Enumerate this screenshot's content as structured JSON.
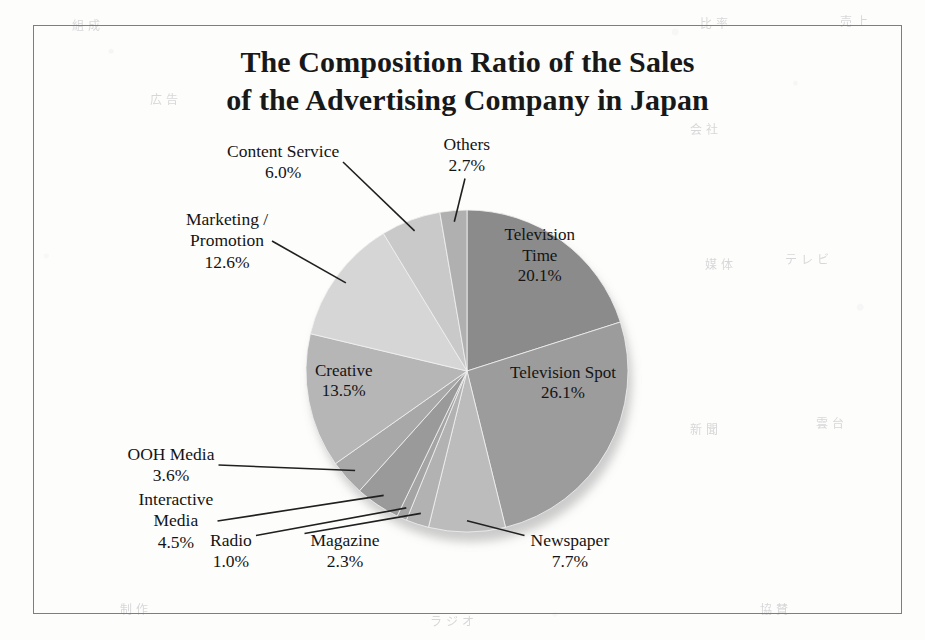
{
  "title": {
    "line1": "The Composition Ratio of the Sales",
    "line2": "of the Advertising Company in Japan"
  },
  "colors": {
    "page_background": "#fdfdfc",
    "frame_border": "#7d7d82",
    "text": "#141414",
    "leader_line": "#202020"
  },
  "ghost_marks": [
    {
      "text": "組 成",
      "x": 72,
      "y": 16
    },
    {
      "text": "比 率",
      "x": 700,
      "y": 14
    },
    {
      "text": "売 上",
      "x": 840,
      "y": 12
    },
    {
      "text": "広 告",
      "x": 150,
      "y": 90
    },
    {
      "text": "会 社",
      "x": 690,
      "y": 120
    },
    {
      "text": "媒 体",
      "x": 705,
      "y": 255
    },
    {
      "text": "テ レ ビ",
      "x": 785,
      "y": 250
    },
    {
      "text": "新 聞",
      "x": 690,
      "y": 420
    },
    {
      "text": "雲 台",
      "x": 816,
      "y": 414
    },
    {
      "text": "制 作",
      "x": 120,
      "y": 600
    },
    {
      "text": "ラ ジ オ",
      "x": 430,
      "y": 612
    },
    {
      "text": "協 賛",
      "x": 760,
      "y": 600
    }
  ],
  "chart_data": {
    "type": "pie",
    "title": "The Composition Ratio of the Sales of the Advertising Company in Japan",
    "unit": "%",
    "start_angle_deg": 0,
    "direction": "clockwise",
    "legend": "none",
    "grid": false,
    "categories": [
      "Television Time",
      "Television Spot",
      "Newspaper",
      "Magazine",
      "Radio",
      "Interactive Media",
      "OOH Media",
      "Creative",
      "Marketing / Promotion",
      "Content Service",
      "Others"
    ],
    "values": [
      20.1,
      26.1,
      7.7,
      2.3,
      1.0,
      4.5,
      3.6,
      13.5,
      12.6,
      6.0,
      2.7
    ],
    "slices": [
      {
        "name": "Television Time",
        "label_line1": "Television",
        "label_line2": "Time",
        "value": 20.1,
        "value_text": "20.1%",
        "color": "#8b8b8b",
        "label_placement": "inside",
        "label_x": 540,
        "label_y": 256
      },
      {
        "name": "Television Spot",
        "label_line1": "Television Spot",
        "label_line2": "",
        "value": 26.1,
        "value_text": "26.1%",
        "color": "#9c9c9c",
        "label_placement": "inside",
        "label_x": 563,
        "label_y": 383
      },
      {
        "name": "Newspaper",
        "label_line1": "Newspaper",
        "label_line2": "",
        "value": 7.7,
        "value_text": "7.7%",
        "color": "#bcbcbc",
        "label_placement": "outside",
        "label_x": 570,
        "label_y": 551
      },
      {
        "name": "Magazine",
        "label_line1": "Magazine",
        "label_line2": "",
        "value": 2.3,
        "value_text": "2.3%",
        "color": "#b2b2b2",
        "label_placement": "outside",
        "label_x": 345,
        "label_y": 551
      },
      {
        "name": "Radio",
        "label_line1": "Radio",
        "label_line2": "",
        "value": 1.0,
        "value_text": "1.0%",
        "color": "#a4a4a4",
        "label_placement": "outside",
        "label_x": 231,
        "label_y": 551
      },
      {
        "name": "Interactive Media",
        "label_line1": "Interactive",
        "label_line2": "Media",
        "value": 4.5,
        "value_text": "4.5%",
        "color": "#9a9a9a",
        "label_placement": "outside",
        "label_x": 176,
        "label_y": 521
      },
      {
        "name": "OOH Media",
        "label_line1": "OOH Media",
        "label_line2": "",
        "value": 3.6,
        "value_text": "3.6%",
        "color": "#a8a8a8",
        "label_placement": "outside",
        "label_x": 171,
        "label_y": 465
      },
      {
        "name": "Creative",
        "label_line1": "Creative",
        "label_line2": "",
        "value": 13.5,
        "value_text": "13.5%",
        "color": "#b6b6b6",
        "label_placement": "inside",
        "label_x": 344,
        "label_y": 381
      },
      {
        "name": "Marketing / Promotion",
        "label_line1": "Marketing /",
        "label_line2": "Promotion",
        "value": 12.6,
        "value_text": "12.6%",
        "color": "#d6d6d6",
        "label_placement": "outside",
        "label_x": 227,
        "label_y": 241
      },
      {
        "name": "Content Service",
        "label_line1": "Content Service",
        "label_line2": "",
        "value": 6.0,
        "value_text": "6.0%",
        "color": "#c9c9c9",
        "label_placement": "outside",
        "label_x": 283,
        "label_y": 162
      },
      {
        "name": "Others",
        "label_line1": "Others",
        "label_line2": "",
        "value": 2.7,
        "value_text": "2.7%",
        "color": "#b0b0b0",
        "label_placement": "outside",
        "label_x": 467,
        "label_y": 155
      }
    ],
    "geometry": {
      "cx": 467,
      "cy": 371,
      "r": 161
    }
  }
}
